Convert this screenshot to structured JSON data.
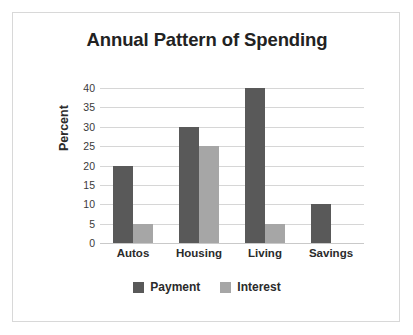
{
  "chart_data": {
    "type": "bar",
    "title": "Annual Pattern of Spending",
    "xlabel": "",
    "ylabel": "Percent",
    "categories": [
      "Autos",
      "Housing",
      "Living",
      "Savings"
    ],
    "series": [
      {
        "name": "Payment",
        "color": "#595959",
        "values": [
          20,
          30,
          40,
          10
        ]
      },
      {
        "name": "Interest",
        "color": "#a6a6a6",
        "values": [
          5,
          25,
          5,
          0
        ]
      }
    ],
    "ylim": [
      0,
      40
    ],
    "yticks": [
      0,
      5,
      10,
      15,
      20,
      25,
      30,
      35,
      40
    ],
    "ytick_labels": [
      "0",
      "5",
      "10",
      "15",
      "20",
      "25",
      "30",
      "35",
      "40"
    ],
    "grid": true,
    "legend_position": "bottom",
    "bar_style": "grouped"
  }
}
